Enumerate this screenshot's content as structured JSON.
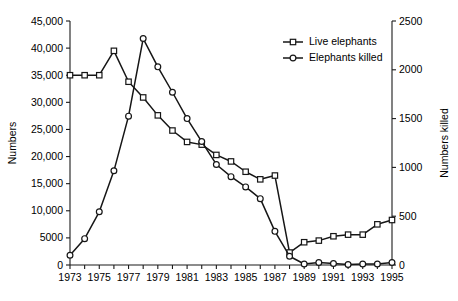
{
  "chart_data": {
    "type": "line",
    "title": "",
    "subtitle": "",
    "xlabel": "",
    "ylabel": "Numbers",
    "y2label": "Numbers killed",
    "grid": false,
    "legend_position": "top-right",
    "x": [
      1973,
      1974,
      1975,
      1976,
      1977,
      1978,
      1979,
      1980,
      1981,
      1982,
      1983,
      1984,
      1985,
      1986,
      1987,
      1988,
      1989,
      1990,
      1991,
      1992,
      1993,
      1994,
      1995
    ],
    "xlim": [
      1973,
      1995
    ],
    "xtick_labels": [
      "1973",
      "1975",
      "1977",
      "1979",
      "1981",
      "1983",
      "1985",
      "1987",
      "1989",
      "1991",
      "1993",
      "1995"
    ],
    "xtick_values": [
      1973,
      1975,
      1977,
      1979,
      1981,
      1983,
      1985,
      1987,
      1989,
      1991,
      1993,
      1995
    ],
    "ylim": [
      0,
      45000
    ],
    "ytick_labels": [
      "0",
      "5000",
      "10,000",
      "15,000",
      "20,000",
      "25,000",
      "30,000",
      "35,000",
      "40,000",
      "45,000"
    ],
    "ytick_values": [
      0,
      5000,
      10000,
      15000,
      20000,
      25000,
      30000,
      35000,
      40000,
      45000
    ],
    "y2lim": [
      0,
      2500
    ],
    "y2tick_labels": [
      "0",
      "500",
      "1000",
      "1500",
      "2000",
      "2500"
    ],
    "y2tick_values": [
      0,
      500,
      1000,
      1500,
      2000,
      2500
    ],
    "series": [
      {
        "name": "Live elephants",
        "axis": "left",
        "marker": "square",
        "values": [
          35000,
          35000,
          35000,
          39500,
          33800,
          30900,
          27600,
          24800,
          22700,
          22200,
          20300,
          19100,
          17200,
          15800,
          16500,
          2300,
          4200,
          4500,
          5300,
          5600,
          5600,
          7500,
          8300
        ]
      },
      {
        "name": "Elephants killed",
        "axis": "right",
        "marker": "circle",
        "values": [
          100,
          270,
          545,
          965,
          1525,
          2320,
          2030,
          1770,
          1500,
          1265,
          1030,
          905,
          800,
          680,
          345,
          90,
          10,
          25,
          15,
          5,
          10,
          10,
          25
        ]
      }
    ]
  },
  "legend": {
    "items": [
      {
        "label": "Live elephants",
        "marker": "square"
      },
      {
        "label": "Elephants killed",
        "marker": "circle"
      }
    ]
  }
}
